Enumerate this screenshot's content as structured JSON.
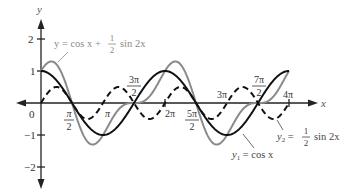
{
  "chart_data": {
    "type": "line",
    "title": "",
    "xlabel": "x",
    "ylabel": "y",
    "xlim": [
      -0.5,
      4.35
    ],
    "xlim_units": "multiples of pi",
    "ylim": [
      -2.3,
      2.5
    ],
    "grid": false,
    "x_tick_labels": [
      {
        "label": "0",
        "value": 0
      },
      {
        "label": "π/2",
        "value": 0.5
      },
      {
        "label": "π",
        "value": 1
      },
      {
        "label": "3π/2",
        "value": 1.5
      },
      {
        "label": "2π",
        "value": 2
      },
      {
        "label": "5π/2",
        "value": 2.5
      },
      {
        "label": "3π",
        "value": 3
      },
      {
        "label": "7π/2",
        "value": 3.5
      },
      {
        "label": "4π",
        "value": 4
      }
    ],
    "y_tick_labels": [
      "2",
      "1",
      "-1",
      "-2"
    ],
    "y_ticks": [
      2,
      1,
      -1,
      -2
    ],
    "series": [
      {
        "name": "y1 = cos x",
        "style": "solid",
        "color": "#111111",
        "formula": "cos(x)",
        "domain": [
          0,
          4
        ]
      },
      {
        "name": "y2 = 1/2 sin 2x",
        "style": "dashed",
        "color": "#111111",
        "formula": "0.5*sin(2x)",
        "domain": [
          0,
          4
        ]
      },
      {
        "name": "y = cos x + 1/2 sin 2x",
        "style": "solid",
        "color": "#8a8a8a",
        "formula": "cos(x)+0.5*sin(2x)",
        "domain": [
          0,
          4
        ]
      }
    ],
    "annotations": [
      {
        "text": "y = cos x + 1/2 sin 2x",
        "target": "sum curve"
      },
      {
        "text": "y1 = cos x",
        "target": "cos curve"
      },
      {
        "text": "y2 = 1/2 sin 2x",
        "target": "dashed curve"
      }
    ]
  },
  "labels": {
    "x_axis": "x",
    "y_axis": "y",
    "origin": "0",
    "y2": "2",
    "y1": "1",
    "ym1": "−1",
    "ym2": "−2",
    "pi_half_num": "π",
    "pi_half_den": "2",
    "pi": "π",
    "three_pi_half_num": "3π",
    "three_pi_half_den": "2",
    "two_pi": "2π",
    "five_pi_half_num": "5π",
    "five_pi_half_den": "2",
    "three_pi": "3π",
    "seven_pi_half_num": "7π",
    "seven_pi_half_den": "2",
    "four_pi": "4π",
    "sum_label_left": "y = cos x + ",
    "sum_label_num": "1",
    "sum_label_den": "2",
    "sum_label_right": "sin 2x",
    "y1_label": "y",
    "y1_sub": "1",
    "y1_rest": " = cos x",
    "y2_label": "y",
    "y2_sub": "2",
    "y2_eq": " = ",
    "y2_num": "1",
    "y2_den": "2",
    "y2_rest": "sin 2x"
  },
  "colors": {
    "primary": "#111111",
    "sum": "#8a8a8a",
    "axis": "#222222"
  }
}
